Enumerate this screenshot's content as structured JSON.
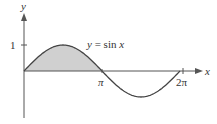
{
  "chart_data": {
    "type": "area",
    "title": "",
    "function_label": "y = sin x",
    "function_label_parts": {
      "lhs": "y",
      "eq": " = sin ",
      "var": "x"
    },
    "xlabel": "x",
    "ylabel": "y",
    "x_ticks": [
      {
        "value": 3.14159,
        "label": "π"
      },
      {
        "value": 6.28318,
        "label": "2π"
      }
    ],
    "y_ticks": [
      {
        "value": 1,
        "label": "1"
      }
    ],
    "xlim": [
      0,
      6.6
    ],
    "ylim": [
      -1.3,
      2.2
    ],
    "shaded_region": {
      "from": 0,
      "to": 3.14159,
      "description": "area under y = sin x between 0 and π"
    },
    "series": [
      {
        "name": "y = sin x",
        "x": [
          0,
          0.785,
          1.571,
          2.356,
          3.142,
          3.927,
          4.712,
          5.498,
          6.283
        ],
        "y": [
          0,
          0.707,
          1,
          0.707,
          0,
          -0.707,
          -1,
          -0.707,
          0
        ]
      }
    ],
    "grid": false,
    "legend": "none",
    "colors": {
      "curve": "#444444",
      "fill": "#cfcfcf",
      "axes": "#444444"
    }
  }
}
